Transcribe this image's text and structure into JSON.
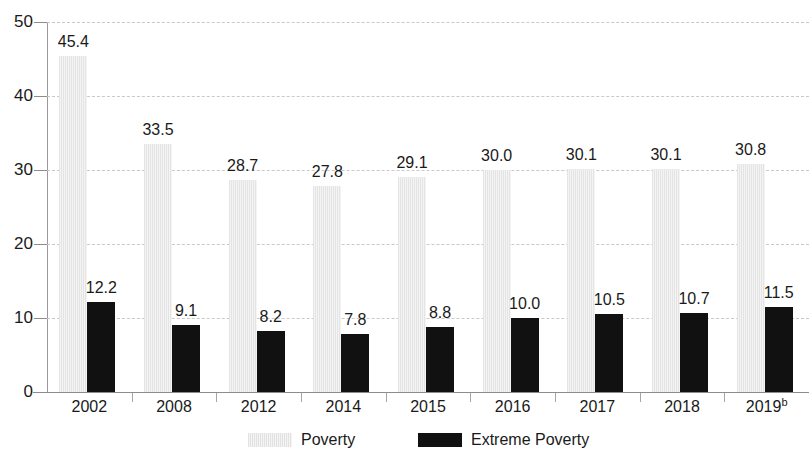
{
  "chart_data": {
    "type": "bar",
    "title": "",
    "subtitle": "",
    "xlabel": "",
    "ylabel": "",
    "ylim": [
      0,
      50
    ],
    "yticks": [
      0,
      10,
      20,
      30,
      40,
      50
    ],
    "ytick_labels": [
      "0",
      "10",
      "20",
      "30",
      "40",
      "50"
    ],
    "grid": true,
    "grid_style": "dashed-horizontal",
    "legend_position": "bottom-center",
    "categories": [
      "2002",
      "2008",
      "2012",
      "2014",
      "2015",
      "2016",
      "2017",
      "2018",
      "2019"
    ],
    "category_notes": [
      "",
      "",
      "",
      "",
      "",
      "",
      "",
      "",
      "b"
    ],
    "series": [
      {
        "name": "Poverty",
        "color": "#e9e9e9",
        "values": [
          45.4,
          33.5,
          28.7,
          27.8,
          29.1,
          30.0,
          30.1,
          30.1,
          30.8
        ],
        "labels": [
          "45.4",
          "33.5",
          "28.7",
          "27.8",
          "29.1",
          "30.0",
          "30.1",
          "30.1",
          "30.8"
        ]
      },
      {
        "name": "Extreme Poverty",
        "color": "#111111",
        "values": [
          12.2,
          9.1,
          8.2,
          7.8,
          8.8,
          10.0,
          10.5,
          10.7,
          11.5
        ],
        "labels": [
          "12.2",
          "9.1",
          "8.2",
          "7.8",
          "8.8",
          "10.0",
          "10.5",
          "10.7",
          "11.5"
        ]
      }
    ]
  },
  "legend": {
    "items": [
      {
        "label": "Poverty",
        "swatch": "poverty"
      },
      {
        "label": "Extreme Poverty",
        "swatch": "extreme"
      }
    ]
  }
}
